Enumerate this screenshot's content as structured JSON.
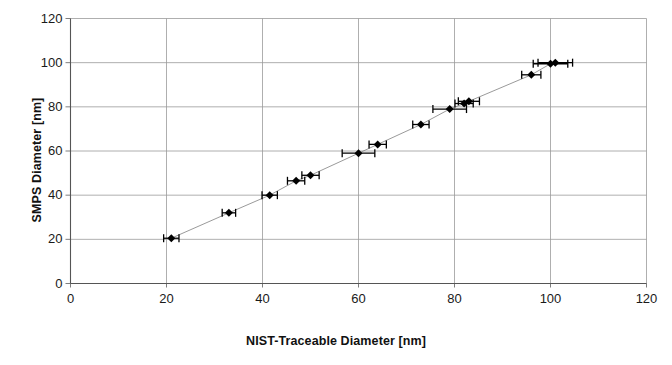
{
  "chart_data": {
    "type": "scatter",
    "title": "",
    "xlabel": "NIST-Traceable Diameter [nm]",
    "ylabel": "SMPS Diameter [nm]",
    "xlim": [
      0,
      120
    ],
    "ylim": [
      0,
      120
    ],
    "xticks": [
      0,
      20,
      40,
      60,
      80,
      100,
      120
    ],
    "yticks": [
      0,
      20,
      40,
      60,
      80,
      100,
      120
    ],
    "xtick_labels": [
      "0",
      "20",
      "40",
      "60",
      "80",
      "100",
      "120"
    ],
    "ytick_labels": [
      "0",
      "20",
      "40",
      "60",
      "80",
      "100",
      "120"
    ],
    "grid": true,
    "legend": false,
    "marker": "diamond",
    "marker_color": "#000000",
    "line_color": "#808080",
    "error_bars": "x",
    "series": [
      {
        "name": "SMPS vs NIST-Traceable Diameter",
        "x": [
          21,
          33,
          41.5,
          47,
          50,
          60,
          64,
          73,
          79,
          82,
          83,
          96,
          100,
          101
        ],
        "y": [
          20.5,
          32,
          40,
          46.5,
          49,
          59,
          63,
          72,
          79,
          81.5,
          82.5,
          94.5,
          99.5,
          100
        ],
        "xerr": [
          1.6,
          1.4,
          1.6,
          1.8,
          1.8,
          3.4,
          1.8,
          1.7,
          3.5,
          1.9,
          2.2,
          2.0,
          3.6,
          3.6
        ]
      }
    ]
  },
  "axes": {
    "x_axis_name": "NIST-Traceable Diameter [nm]",
    "y_axis_name": "SMPS Diameter [nm]"
  }
}
